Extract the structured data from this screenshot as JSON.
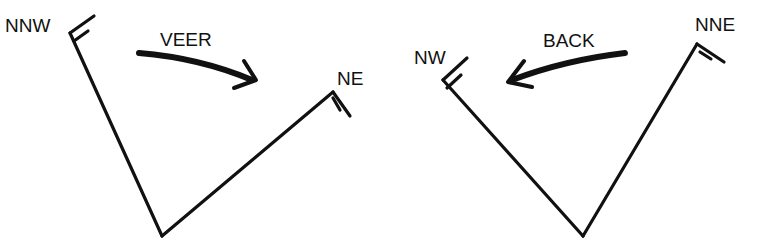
{
  "diagrams": [
    {
      "name": "veer",
      "start_direction": "NNW",
      "end_direction": "NE",
      "change_label": "VEER"
    },
    {
      "name": "back",
      "start_direction": "NNE",
      "end_direction": "NW",
      "change_label": "BACK"
    }
  ],
  "colors": {
    "ink": "#111111",
    "background": "#ffffff"
  }
}
